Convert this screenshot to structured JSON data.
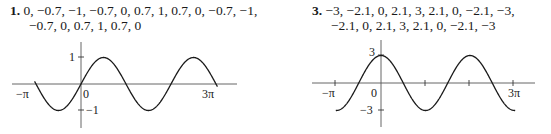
{
  "problems": [
    {
      "number": "1.",
      "line1": "0, −0.7, −1, −0.7, 0, 0.7, 1, 0.7, 0, −0.7, −1,",
      "line2": "−0.7, 0, 0.7, 1, 0.7, 0"
    },
    {
      "number": "3.",
      "line1": "−3, −2.1, 0, 2.1, 3, 2.1, 0, −2.1, −3,",
      "line2": "−2.1, 0, 2.1, 3, 2.1, 0, −2.1, −3"
    }
  ],
  "graphs": [
    {
      "labels": {
        "ymax": "1",
        "ymin": "−1",
        "origin": "0",
        "xmin": "−π",
        "xmax": "3π"
      }
    },
    {
      "labels": {
        "ymax": "3",
        "ymin": "−3",
        "origin": "0",
        "xmin": "−π",
        "xmax": "3π"
      }
    }
  ],
  "chart_data": [
    {
      "type": "line",
      "title": "1.",
      "function": "y = sin x",
      "x": [
        "−π",
        "−3π/4",
        "−π/2",
        "−π/4",
        "0",
        "π/4",
        "π/2",
        "3π/4",
        "π",
        "5π/4",
        "3π/2",
        "7π/4",
        "2π",
        "9π/4",
        "5π/2",
        "11π/4",
        "3π"
      ],
      "values": [
        0,
        -0.7,
        -1,
        -0.7,
        0,
        0.7,
        1,
        0.7,
        0,
        -0.7,
        -1,
        -0.7,
        0,
        0.7,
        1,
        0.7,
        0
      ],
      "xlabel": "",
      "ylabel": "",
      "xlim": [
        "−π",
        "3π"
      ],
      "ylim": [
        -1,
        1
      ],
      "tick_labels": {
        "x": [
          "−π",
          "0",
          "3π"
        ],
        "y": [
          "1",
          "−1"
        ]
      },
      "grid": false
    },
    {
      "type": "line",
      "title": "3.",
      "function": "y = 3 cos x",
      "x": [
        "−π",
        "−3π/4",
        "−π/2",
        "−π/4",
        "0",
        "π/4",
        "π/2",
        "3π/4",
        "π",
        "5π/4",
        "3π/2",
        "7π/4",
        "2π",
        "9π/4",
        "5π/2",
        "11π/4",
        "3π"
      ],
      "values": [
        -3,
        -2.1,
        0,
        2.1,
        3,
        2.1,
        0,
        -2.1,
        -3,
        -2.1,
        0,
        2.1,
        3,
        2.1,
        0,
        -2.1,
        -3
      ],
      "xlabel": "",
      "ylabel": "",
      "xlim": [
        "−π",
        "3π"
      ],
      "ylim": [
        -3,
        3
      ],
      "tick_labels": {
        "x": [
          "−π",
          "0",
          "3π"
        ],
        "y": [
          "3",
          "−3"
        ]
      },
      "grid": false
    }
  ]
}
